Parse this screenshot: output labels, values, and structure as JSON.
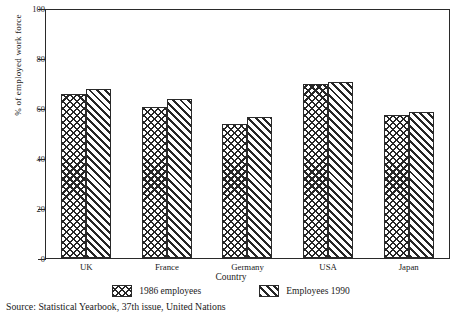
{
  "chart_data": {
    "type": "bar",
    "title": "",
    "xlabel": "Country",
    "ylabel": "% of employed work force",
    "categories": [
      "UK",
      "France",
      "Germany",
      "USA",
      "Japan"
    ],
    "series": [
      {
        "name": "1986 employees",
        "pattern": "cross-hatch",
        "values": [
          66,
          61,
          54,
          70,
          57.5
        ]
      },
      {
        "name": "Employees 1990",
        "pattern": "diagonal-stripes",
        "values": [
          68,
          64,
          57,
          71,
          59
        ]
      }
    ],
    "ylim": [
      0,
      100
    ],
    "yticks": [
      0,
      20,
      40,
      60,
      80,
      100
    ],
    "ytick_labels": [
      "0",
      "20",
      "40",
      "60",
      "80",
      "100"
    ],
    "grid": false,
    "legend_position": "bottom",
    "colors": {
      "ink": "#262626",
      "background": "#ffffff"
    }
  },
  "source": {
    "text": "Source: Statistical Yearbook, 37th issue, United Nations"
  }
}
